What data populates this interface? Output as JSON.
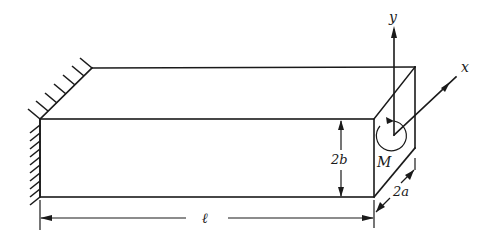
{
  "diagram": {
    "type": "cantilever rectangular beam under end moment",
    "labels": {
      "length": "ℓ",
      "height": "2b",
      "width": "2a",
      "moment": "M",
      "x_axis": "x",
      "y_axis": "y"
    },
    "support": "fixed wall (hatched) at left end",
    "colors": {
      "line": "#1a1a1a",
      "background": "#ffffff"
    }
  }
}
